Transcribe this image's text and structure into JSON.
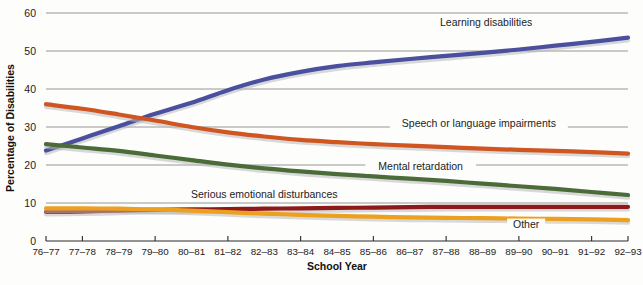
{
  "chart_data": {
    "type": "line",
    "title": "",
    "xlabel": "School Year",
    "ylabel": "Percentage of Disabilities",
    "ylim": [
      0,
      60
    ],
    "yticks": [
      0,
      10,
      20,
      30,
      40,
      50,
      60
    ],
    "grid": true,
    "legend_position": "inline-annotations",
    "categories": [
      "76–77",
      "77–78",
      "78–79",
      "79–80",
      "80–81",
      "81–82",
      "82–83",
      "83–84",
      "84–85",
      "85–86",
      "86–87",
      "87–88",
      "88–89",
      "89–90",
      "90–91",
      "91–92",
      "92–93"
    ],
    "series": [
      {
        "name": "Learning disabilities",
        "color": "#4a4f9e",
        "label_x_index": 12.1,
        "label_y": 56.5,
        "values": [
          23.8,
          27.0,
          30.2,
          33.5,
          36.4,
          39.7,
          42.5,
          44.5,
          46.0,
          47.0,
          47.9,
          48.7,
          49.5,
          50.4,
          51.4,
          52.4,
          53.5
        ]
      },
      {
        "name": "Speech or language impairments",
        "color": "#cf5521",
        "label_x_index": 11.9,
        "label_y": 30.0,
        "values": [
          36.0,
          34.8,
          33.3,
          31.7,
          30.0,
          28.6,
          27.5,
          26.6,
          26.0,
          25.5,
          25.1,
          24.7,
          24.3,
          24.0,
          23.7,
          23.4,
          23.0
        ]
      },
      {
        "name": "Mental retardation",
        "color": "#4b6b39",
        "label_x_index": 10.3,
        "label_y": 18.6,
        "values": [
          25.5,
          24.6,
          23.7,
          22.5,
          21.3,
          20.1,
          19.1,
          18.3,
          17.6,
          17.0,
          16.4,
          15.8,
          15.1,
          14.4,
          13.7,
          12.9,
          12.1
        ]
      },
      {
        "name": "Serious emotional disturbances",
        "color": "#8e1919",
        "label_x_index": 6.0,
        "label_y": 11.3,
        "values": [
          7.7,
          7.8,
          8.0,
          8.2,
          8.3,
          8.4,
          8.5,
          8.6,
          8.7,
          8.8,
          8.9,
          9.0,
          9.0,
          9.0,
          9.0,
          9.0,
          9.0
        ]
      },
      {
        "name": "Other",
        "color": "#eda01f",
        "label_x_index": 13.2,
        "label_y": 3.4,
        "values": [
          8.6,
          8.6,
          8.5,
          8.3,
          8.0,
          7.6,
          7.2,
          6.9,
          6.6,
          6.4,
          6.2,
          6.1,
          6.0,
          5.9,
          5.8,
          5.7,
          5.5
        ]
      }
    ]
  }
}
